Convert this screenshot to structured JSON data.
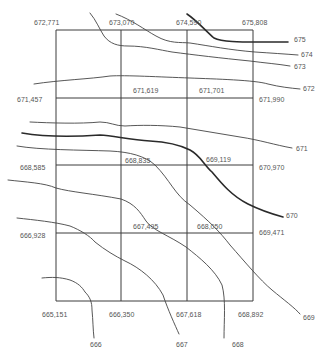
{
  "map": {
    "type": "contour-grid",
    "grid_lines_x": [
      56,
      121,
      187,
      253
    ],
    "grid_lines_y": [
      30,
      98,
      165,
      233,
      301
    ],
    "spot_heights": [
      {
        "text": "672,771",
        "x": 34,
        "y": 25
      },
      {
        "text": "673,070",
        "x": 109,
        "y": 25
      },
      {
        "text": "674,590",
        "x": 176,
        "y": 25
      },
      {
        "text": "675,808",
        "x": 242,
        "y": 25
      },
      {
        "text": "671,619",
        "x": 133,
        "y": 93
      },
      {
        "text": "671,701",
        "x": 199,
        "y": 93
      },
      {
        "text": "671,457",
        "x": 17,
        "y": 102
      },
      {
        "text": "671,990",
        "x": 259,
        "y": 102
      },
      {
        "text": "668,835",
        "x": 125,
        "y": 163
      },
      {
        "text": "669,119",
        "x": 206,
        "y": 162
      },
      {
        "text": "668,585",
        "x": 20,
        "y": 170
      },
      {
        "text": "670,970",
        "x": 259,
        "y": 170
      },
      {
        "text": "667,495",
        "x": 133,
        "y": 229
      },
      {
        "text": "668,050",
        "x": 197,
        "y": 229
      },
      {
        "text": "666,928",
        "x": 20,
        "y": 238
      },
      {
        "text": "669,471",
        "x": 259,
        "y": 235
      },
      {
        "text": "665,151",
        "x": 42,
        "y": 317
      },
      {
        "text": "666,350",
        "x": 109,
        "y": 317
      },
      {
        "text": "667,618",
        "x": 176,
        "y": 317
      },
      {
        "text": "668,892",
        "x": 238,
        "y": 317
      }
    ],
    "contour_labels": [
      {
        "text": "675",
        "x": 294,
        "y": 42
      },
      {
        "text": "674",
        "x": 301,
        "y": 57
      },
      {
        "text": "673",
        "x": 294,
        "y": 69
      },
      {
        "text": "672",
        "x": 303,
        "y": 91
      },
      {
        "text": "671",
        "x": 296,
        "y": 151
      },
      {
        "text": "670",
        "x": 286,
        "y": 218
      },
      {
        "text": "669",
        "x": 303,
        "y": 320
      },
      {
        "text": "668",
        "x": 232,
        "y": 347
      },
      {
        "text": "667",
        "x": 176,
        "y": 347
      },
      {
        "text": "666",
        "x": 90,
        "y": 347
      }
    ]
  }
}
